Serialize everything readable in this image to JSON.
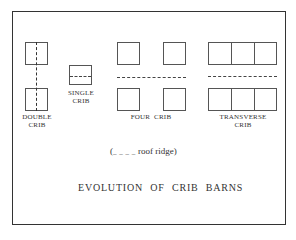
{
  "diagram": {
    "title": "EVOLUTION OF CRIB BARNS",
    "legend": {
      "open": "(",
      "dash_symbol": "_ _ _ _",
      "text": "roof ridge)"
    },
    "groups": [
      {
        "id": "double-crib",
        "label_line1": "DOUBLE",
        "label_line2": "CRIB",
        "ridge": "vertical",
        "cribs": 2
      },
      {
        "id": "single-crib",
        "label_line1": "SINGLE",
        "label_line2": "CRIB",
        "ridge": "horizontal",
        "cribs": 1
      },
      {
        "id": "four-crib",
        "label_line1": "FOUR  CRIB",
        "label_line2": "",
        "ridge": "horizontal",
        "cribs": 4
      },
      {
        "id": "transverse-crib",
        "label_line1": "TRANSVERSE",
        "label_line2": "CRIB",
        "ridge": "horizontal",
        "cribs": 6
      }
    ]
  }
}
